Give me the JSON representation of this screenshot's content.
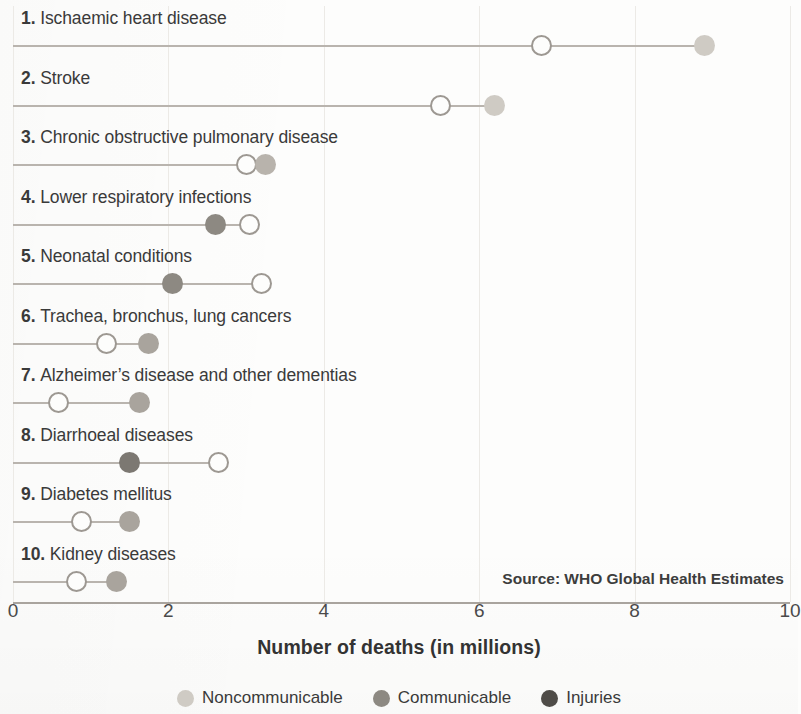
{
  "chart_data": {
    "type": "scatter",
    "subtype": "dumbbell",
    "title": "",
    "xlabel": "Number of deaths (in millions)",
    "ylabel": "",
    "xlim": [
      0,
      10
    ],
    "xticks": [
      0,
      2,
      4,
      6,
      8,
      10
    ],
    "xtick_labels": [
      "0",
      "2",
      "4",
      "6",
      "8",
      "10"
    ],
    "grid": true,
    "legend_position": "bottom",
    "source_note": "Source: WHO Global Health Estimates",
    "legend": [
      {
        "label": "Noncommunicable",
        "color": "#cfcbc4"
      },
      {
        "label": "Communicable",
        "color": "#8d8982"
      },
      {
        "label": "Injuries",
        "color": "#4f4c48"
      }
    ],
    "categories": [
      "1. Ischaemic heart disease",
      "2. Stroke",
      "3. Chronic obstructive pulmonary disease",
      "4. Lower respiratory infections",
      "5. Neonatal conditions",
      "6. Trachea, bronchus, lung cancers",
      "7. Alzheimer’s disease and other dementias",
      "8. Diarrhoeal diseases",
      "9. Diabetes mellitus",
      "10. Kidney diseases"
    ],
    "series": [
      {
        "name": "Earlier year (hollow marker)",
        "values": [
          6.8,
          5.5,
          3.0,
          2.6,
          2.05,
          1.2,
          0.58,
          1.5,
          0.88,
          0.82
        ]
      },
      {
        "name": "Latest year (filled marker)",
        "values": [
          8.9,
          6.2,
          3.25,
          3.05,
          3.2,
          1.75,
          1.63,
          2.65,
          1.5,
          1.33
        ]
      }
    ],
    "rows": [
      {
        "rank": "1.",
        "name": "Ischaemic heart disease",
        "start": 6.8,
        "end": 8.9,
        "group": "Noncommunicable",
        "color": "#cfcbc4",
        "start_marker": "hollow",
        "end_marker": "filled"
      },
      {
        "rank": "2.",
        "name": "Stroke",
        "start": 5.5,
        "end": 6.2,
        "group": "Noncommunicable",
        "color": "#cfcbc4",
        "start_marker": "hollow",
        "end_marker": "filled"
      },
      {
        "rank": "3.",
        "name": "Chronic obstructive pulmonary disease",
        "start": 3.0,
        "end": 3.25,
        "group": "Noncommunicable",
        "color": "#b8b3ac",
        "start_marker": "hollow",
        "end_marker": "filled"
      },
      {
        "rank": "4.",
        "name": "Lower respiratory infections",
        "start": 3.05,
        "end": 2.6,
        "group": "Communicable",
        "color": "#8d8982",
        "start_marker": "hollow",
        "end_marker": "filled"
      },
      {
        "rank": "5.",
        "name": "Neonatal conditions",
        "start": 3.2,
        "end": 2.05,
        "group": "Communicable",
        "color": "#8d8982",
        "start_marker": "hollow",
        "end_marker": "filled"
      },
      {
        "rank": "6.",
        "name": "Trachea, bronchus, lung cancers",
        "start": 1.2,
        "end": 1.75,
        "group": "Noncommunicable",
        "color": "#a9a49d",
        "start_marker": "hollow",
        "end_marker": "filled"
      },
      {
        "rank": "7.",
        "name": "Alzheimer’s disease and other dementias",
        "start": 0.58,
        "end": 1.63,
        "group": "Noncommunicable",
        "color": "#a9a49d",
        "start_marker": "hollow",
        "end_marker": "filled"
      },
      {
        "rank": "8.",
        "name": "Diarrhoeal diseases",
        "start": 2.65,
        "end": 1.5,
        "group": "Communicable",
        "color": "#7c7872",
        "start_marker": "hollow",
        "end_marker": "filled"
      },
      {
        "rank": "9.",
        "name": "Diabetes mellitus",
        "start": 0.88,
        "end": 1.5,
        "group": "Noncommunicable",
        "color": "#a9a49d",
        "start_marker": "hollow",
        "end_marker": "filled"
      },
      {
        "rank": "10.",
        "name": "Kidney diseases",
        "start": 0.82,
        "end": 1.33,
        "group": "Noncommunicable",
        "color": "#a9a49d",
        "start_marker": "hollow",
        "end_marker": "filled"
      }
    ]
  }
}
